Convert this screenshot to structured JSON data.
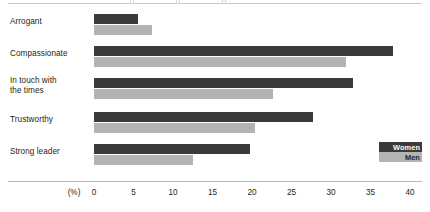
{
  "chart_data": {
    "type": "bar",
    "orientation": "horizontal",
    "title": "",
    "xlabel": "(%)",
    "ylabel": "",
    "xlim": [
      0,
      40
    ],
    "xticks": [
      0,
      5,
      10,
      15,
      20,
      25,
      30,
      35,
      40
    ],
    "xticklabels": [
      "0",
      "5",
      "10",
      "15",
      "20",
      "25",
      "30",
      "35",
      "40"
    ],
    "grid": false,
    "legend_position": "bottom-right",
    "categories": [
      "Arrogant",
      "Compassionate",
      "In touch with\nthe times",
      "Trustworthy",
      "Strong leader"
    ],
    "series": [
      {
        "name": "Women",
        "color": "#3b3b3b",
        "values": [
          5.6,
          37.8,
          32.8,
          27.7,
          19.7
        ]
      },
      {
        "name": "Men",
        "color": "#b3b3b3",
        "values": [
          7.3,
          31.9,
          22.7,
          20.4,
          12.5
        ]
      }
    ]
  },
  "axis": {
    "unit_label": "(%)"
  },
  "legend": {
    "items": [
      {
        "label": "Women",
        "color": "#3b3b3b"
      },
      {
        "label": "Men",
        "color": "#b3b3b3"
      }
    ]
  }
}
